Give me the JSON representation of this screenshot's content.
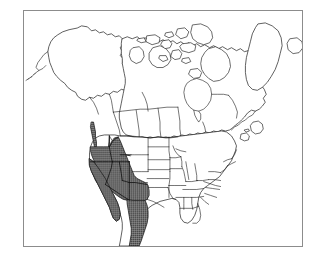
{
  "figure": {
    "width_px": 319,
    "height_px": 259,
    "background_color": "#ffffff",
    "frame": {
      "border_color": "#8c8c8c",
      "fill_color": "#ffffff",
      "left_px": 23,
      "top_px": 10,
      "width_px": 280,
      "height_px": 237
    }
  },
  "map": {
    "projection_hint": "conic, North America",
    "coastline_color": "#1a1a1a",
    "internal_border_color": "#1a1a1a",
    "land_fill_color": "#ffffff",
    "range_fill_color": "#6a6a6a",
    "range_pattern": "fine-stipple",
    "labels": [],
    "legend": [],
    "regions_shown": [
      "Alaska",
      "Canada",
      "Greenland",
      "Contiguous United States",
      "Northern Mexico",
      "Baja California",
      "Great Lakes",
      "Hudson Bay",
      "Arctic Archipelago"
    ],
    "range_regions": [
      "Oregon",
      "California",
      "Nevada",
      "Idaho",
      "Utah",
      "Arizona",
      "New Mexico",
      "Western Colorado",
      "Western Wyoming",
      "Baja California",
      "Northwestern Mexico",
      "Coastal Washington"
    ]
  }
}
